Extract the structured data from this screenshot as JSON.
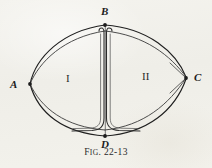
{
  "figure": {
    "caption_prefix": "F",
    "caption_smallcaps": "IG",
    "caption_suffix": ". 22-13",
    "caption_full": "Fig. 22-13",
    "number": "22-13",
    "background_color": "#f2f1ec",
    "ink_color": "#1c1c1c"
  },
  "vertices": [
    {
      "id": "A",
      "label": "A",
      "x": 30,
      "y": 84,
      "label_x": 10,
      "label_y": 80,
      "position": "left"
    },
    {
      "id": "B",
      "label": "B",
      "x": 105,
      "y": 25,
      "label_x": 101,
      "label_y": 7,
      "position": "top"
    },
    {
      "id": "C",
      "label": "C",
      "x": 186,
      "y": 77,
      "label_x": 194,
      "label_y": 72,
      "position": "right"
    },
    {
      "id": "D",
      "label": "D",
      "x": 105,
      "y": 135,
      "label_x": 101,
      "label_y": 139,
      "position": "bottom"
    }
  ],
  "regions": [
    {
      "id": "I",
      "label": "I",
      "x": 66,
      "y": 73,
      "side": "left"
    },
    {
      "id": "II",
      "label": "II",
      "x": 143,
      "y": 71,
      "side": "right"
    }
  ],
  "edges": [
    {
      "name": "outer-arc-A-B-upper",
      "from": "A",
      "to": "B"
    },
    {
      "name": "inner-arc-A-B-lower",
      "from": "A",
      "to": "B"
    },
    {
      "name": "outer-arc-B-C-upper",
      "from": "B",
      "to": "C"
    },
    {
      "name": "inner-arc-B-C-lower",
      "from": "B",
      "to": "C"
    },
    {
      "name": "outer-arc-A-D-lower",
      "from": "A",
      "to": "D"
    },
    {
      "name": "inner-arc-A-D-upper",
      "from": "A",
      "to": "D"
    },
    {
      "name": "outer-arc-D-C-lower",
      "from": "D",
      "to": "C"
    },
    {
      "name": "inner-arc-D-C-upper",
      "from": "D",
      "to": "C"
    },
    {
      "name": "central-segment-B-D",
      "from": "B",
      "to": "D"
    },
    {
      "name": "channel-left-B-D",
      "from": "B",
      "to": "D"
    },
    {
      "name": "channel-right-B-D",
      "from": "B",
      "to": "D"
    }
  ],
  "styles": {
    "stroke_thin": "#3a3a3a",
    "stroke_main": "#1f1f1f",
    "stroke_width_main": 1.15,
    "stroke_width_thin": 0.85
  }
}
